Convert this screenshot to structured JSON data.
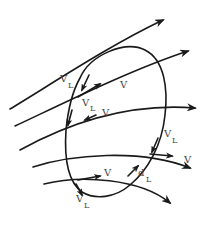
{
  "diagram": {
    "colors": {
      "line": "#1a1a1a",
      "label": "#444444",
      "background": "#ffffff"
    },
    "labels": {
      "vl_top_left": {
        "main": "V",
        "sub": "L"
      },
      "v_top_center": {
        "main": "V"
      },
      "vl_mid_left": {
        "main": "V",
        "sub": "L"
      },
      "v_mid_left": {
        "main": "V"
      },
      "vl_right": {
        "main": "V",
        "sub": "L"
      },
      "v_right": {
        "main": "V"
      },
      "v_bottom": {
        "main": "V"
      },
      "dl_bottom": {
        "main": "d",
        "sub": "L"
      },
      "vl_bottom": {
        "main": "V",
        "sub": "L"
      }
    },
    "flow_lines": [
      {
        "id": "line-1",
        "arrow": true
      },
      {
        "id": "line-2",
        "arrow": true
      },
      {
        "id": "line-3",
        "arrow": true
      },
      {
        "id": "line-4",
        "arrow": true
      },
      {
        "id": "line-5",
        "arrow": true
      }
    ],
    "loop": {
      "shape": "ellipse",
      "tilted": true
    }
  }
}
